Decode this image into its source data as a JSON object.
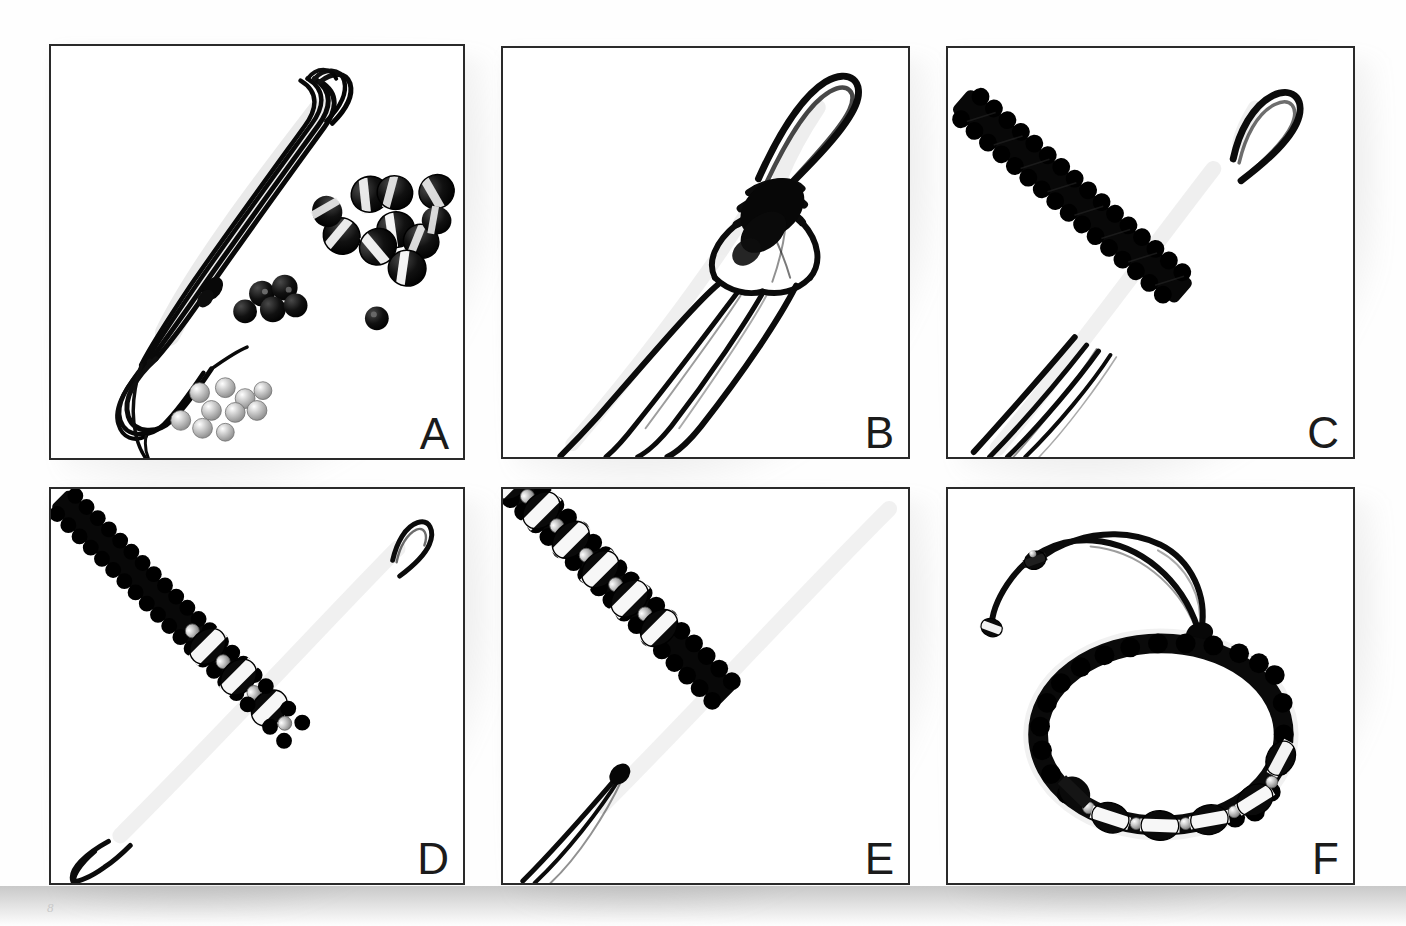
{
  "figure": {
    "kind": "step-by-step photo sequence",
    "panel_count": 6,
    "background_color": "#ffffff",
    "border_color": "#2a2a2a",
    "cord_color": "#111111",
    "bead_black_color": "#0d0d0d",
    "bead_white_color": "#f4f4f4",
    "bead_silver_color": "#b8b8b8",
    "page_mark": "8"
  },
  "panels": [
    {
      "id": "A",
      "label": "A",
      "caption": "Materials: coiled black cord, black-and-white striped beads, small black beads, small silver beads",
      "x": 49,
      "y": 44,
      "w": 416,
      "h": 416,
      "items": [
        {
          "name": "coiled-cord",
          "count": 1
        },
        {
          "name": "striped-bead-pile",
          "count": 11
        },
        {
          "name": "small-black-bead-cluster",
          "count": 5
        },
        {
          "name": "single-black-bead",
          "count": 1
        },
        {
          "name": "silver-bead-scatter",
          "count": 10
        }
      ]
    },
    {
      "id": "B",
      "label": "B",
      "caption": "Cords folded to form a loop; first square knots tied below the loop, four working strands hanging",
      "x": 501,
      "y": 46,
      "w": 409,
      "h": 413,
      "items": [
        {
          "name": "loop",
          "count": 1
        },
        {
          "name": "knot-bundle",
          "count": 1
        },
        {
          "name": "hanging-strand",
          "count": 4
        }
      ]
    },
    {
      "id": "C",
      "label": "C",
      "caption": "A length of square knots braided beneath the loop",
      "x": 946,
      "y": 46,
      "w": 409,
      "h": 413,
      "items": [
        {
          "name": "loop",
          "count": 1
        },
        {
          "name": "square-knot-braid",
          "count": 1
        },
        {
          "name": "hanging-strand",
          "count": 4
        }
      ]
    },
    {
      "id": "D",
      "label": "D",
      "caption": "Beads threaded onto the filler cords and secured between knots",
      "x": 49,
      "y": 487,
      "w": 416,
      "h": 398,
      "items": [
        {
          "name": "loop",
          "count": 1
        },
        {
          "name": "square-knot-braid",
          "count": 1
        },
        {
          "name": "striped-bead",
          "count": 3
        },
        {
          "name": "silver-bead",
          "count": 4
        }
      ]
    },
    {
      "id": "E",
      "label": "E",
      "caption": "Beading continued along the braid with alternating striped and silver beads",
      "x": 501,
      "y": 487,
      "w": 409,
      "h": 398,
      "items": [
        {
          "name": "square-knot-braid",
          "count": 1
        },
        {
          "name": "striped-bead",
          "count": 6
        },
        {
          "name": "silver-bead",
          "count": 6
        },
        {
          "name": "hanging-strand",
          "count": 3
        }
      ]
    },
    {
      "id": "F",
      "label": "F",
      "caption": "Finished adjustable bracelet with sliding closure and beaded end caps",
      "x": 946,
      "y": 487,
      "w": 409,
      "h": 398,
      "items": [
        {
          "name": "finished-bracelet",
          "count": 1
        },
        {
          "name": "sliding-closure-knot",
          "count": 1
        },
        {
          "name": "end-cap-bead",
          "count": 2
        },
        {
          "name": "striped-bead",
          "count": 5
        },
        {
          "name": "silver-bead",
          "count": 5
        }
      ]
    }
  ]
}
